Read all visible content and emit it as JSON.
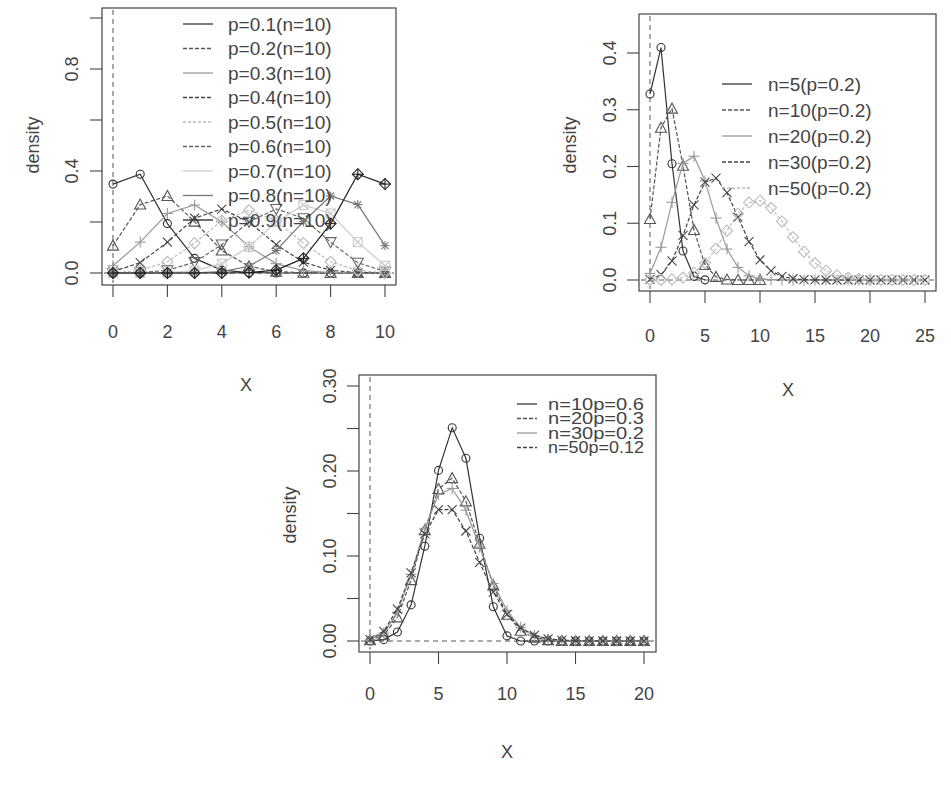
{
  "chart_data": [
    {
      "type": "line",
      "title": "",
      "xlabel": "X",
      "ylabel": "density",
      "xlim": [
        0,
        10
      ],
      "ylim": [
        0,
        1
      ],
      "x_ticks": [
        0,
        2,
        4,
        6,
        8,
        10
      ],
      "y_ticks": [
        0.0,
        0.2,
        0.4,
        0.6,
        0.8,
        1.0
      ],
      "y_tick_labels": [
        "0.0",
        "",
        "0.4",
        "",
        "0.8",
        ""
      ],
      "grid": false,
      "legend_position": "top-center",
      "x": [
        0,
        1,
        2,
        3,
        4,
        5,
        6,
        7,
        8,
        9,
        10
      ],
      "series": [
        {
          "name": "p=0.1(n=10)",
          "marker": "circle",
          "color": "#333333",
          "dash": "",
          "values": [
            0.3487,
            0.3874,
            0.1937,
            0.0574,
            0.0112,
            0.0015,
            0.0001,
            0.0,
            0.0,
            0.0,
            0.0
          ]
        },
        {
          "name": "p=0.2(n=10)",
          "marker": "triangle",
          "color": "#555555",
          "dash": "4,2",
          "values": [
            0.1074,
            0.2684,
            0.302,
            0.2013,
            0.0881,
            0.0264,
            0.0055,
            0.0008,
            0.0001,
            0.0,
            0.0
          ]
        },
        {
          "name": "p=0.3(n=10)",
          "marker": "plus",
          "color": "#999999",
          "dash": "",
          "values": [
            0.0282,
            0.1211,
            0.2335,
            0.2668,
            0.2001,
            0.1029,
            0.0368,
            0.009,
            0.0014,
            0.0001,
            0.0
          ]
        },
        {
          "name": "p=0.4(n=10)",
          "marker": "cross",
          "color": "#444444",
          "dash": "4,2",
          "values": [
            0.006,
            0.0403,
            0.1209,
            0.215,
            0.2508,
            0.2007,
            0.1115,
            0.0425,
            0.0106,
            0.0016,
            0.0001
          ]
        },
        {
          "name": "p=0.5(n=10)",
          "marker": "diamond",
          "color": "#bbbbbb",
          "dash": "3,2",
          "values": [
            0.001,
            0.0098,
            0.0439,
            0.1172,
            0.2051,
            0.2461,
            0.2051,
            0.1172,
            0.0439,
            0.0098,
            0.001
          ]
        },
        {
          "name": "p=0.6(n=10)",
          "marker": "triangle-down",
          "color": "#666666",
          "dash": "4,2",
          "values": [
            0.0001,
            0.0016,
            0.0106,
            0.0425,
            0.1115,
            0.2007,
            0.2508,
            0.215,
            0.1209,
            0.0403,
            0.006
          ]
        },
        {
          "name": "p=0.7(n=10)",
          "marker": "square-x",
          "color": "#cccccc",
          "dash": "",
          "values": [
            0.0,
            0.0001,
            0.0014,
            0.009,
            0.0368,
            0.1029,
            0.2001,
            0.2668,
            0.2335,
            0.1211,
            0.0282
          ]
        },
        {
          "name": "p=0.8(n=10)",
          "marker": "asterisk",
          "color": "#777777",
          "dash": "",
          "values": [
            0.0,
            0.0,
            0.0001,
            0.0008,
            0.0055,
            0.0264,
            0.0881,
            0.2013,
            0.302,
            0.2684,
            0.1074
          ]
        },
        {
          "name": "p=0.9(n=10)",
          "marker": "diamond-plus",
          "color": "#222222",
          "dash": "",
          "values": [
            0.0,
            0.0,
            0.0,
            0.0,
            0.0001,
            0.0015,
            0.0112,
            0.0574,
            0.1937,
            0.3874,
            0.3487
          ]
        }
      ]
    },
    {
      "type": "line",
      "title": "",
      "xlabel": "X",
      "ylabel": "density",
      "xlim": [
        0,
        25
      ],
      "ylim": [
        0,
        0.45
      ],
      "x_ticks": [
        0,
        5,
        10,
        15,
        20,
        25
      ],
      "y_ticks": [
        0.0,
        0.1,
        0.2,
        0.3,
        0.4
      ],
      "y_tick_labels": [
        "0.0",
        "0.1",
        "0.2",
        "0.3",
        "0.4"
      ],
      "grid": false,
      "legend_position": "top-right",
      "series": [
        {
          "name": "n=5(p=0.2)",
          "marker": "circle",
          "color": "#333333",
          "dash": "",
          "x": [
            0,
            1,
            2,
            3,
            4,
            5
          ],
          "values": [
            0.3277,
            0.4096,
            0.2048,
            0.0512,
            0.0064,
            0.0003
          ]
        },
        {
          "name": "n=10(p=0.2)",
          "marker": "triangle",
          "color": "#555555",
          "dash": "4,2",
          "x": [
            0,
            1,
            2,
            3,
            4,
            5,
            6,
            7,
            8,
            9,
            10
          ],
          "values": [
            0.1074,
            0.2684,
            0.302,
            0.2013,
            0.0881,
            0.0264,
            0.0055,
            0.0008,
            0.0001,
            0.0,
            0.0
          ]
        },
        {
          "name": "n=20(p=0.2)",
          "marker": "plus",
          "color": "#999999",
          "dash": "",
          "x": [
            0,
            1,
            2,
            3,
            4,
            5,
            6,
            7,
            8,
            9,
            10,
            11,
            12,
            13,
            14,
            15,
            16,
            17,
            18,
            19,
            20
          ],
          "values": [
            0.0115,
            0.0576,
            0.1369,
            0.2054,
            0.2182,
            0.1746,
            0.1091,
            0.0545,
            0.0222,
            0.0074,
            0.002,
            0.0005,
            0.0001,
            0,
            0,
            0,
            0,
            0,
            0,
            0,
            0
          ]
        },
        {
          "name": "n=30(p=0.2)",
          "marker": "cross",
          "color": "#444444",
          "dash": "4,2",
          "x": [
            0,
            1,
            2,
            3,
            4,
            5,
            6,
            7,
            8,
            9,
            10,
            11,
            12,
            13,
            14,
            15,
            16,
            17,
            18,
            19,
            20,
            21,
            22,
            23,
            24,
            25
          ],
          "values": [
            0.0012,
            0.0093,
            0.0337,
            0.0785,
            0.1325,
            0.1723,
            0.1795,
            0.1538,
            0.1106,
            0.0676,
            0.0355,
            0.0161,
            0.0064,
            0.0022,
            0.0007,
            0.0002,
            0.0,
            0,
            0,
            0,
            0,
            0,
            0,
            0,
            0,
            0
          ]
        },
        {
          "name": "n=50(p=0.2)",
          "marker": "diamond",
          "color": "#bbbbbb",
          "dash": "3,2",
          "x": [
            0,
            1,
            2,
            3,
            4,
            5,
            6,
            7,
            8,
            9,
            10,
            11,
            12,
            13,
            14,
            15,
            16,
            17,
            18,
            19,
            20,
            21,
            22,
            23,
            24,
            25
          ],
          "values": [
            0.0,
            0.0002,
            0.0011,
            0.0044,
            0.0128,
            0.0295,
            0.0554,
            0.087,
            0.1169,
            0.1364,
            0.1398,
            0.1271,
            0.1033,
            0.0755,
            0.0499,
            0.0299,
            0.0164,
            0.0082,
            0.0037,
            0.0016,
            0.0006,
            0.0002,
            0.0001,
            0,
            0,
            0
          ]
        }
      ]
    },
    {
      "type": "line",
      "title": "",
      "xlabel": "X",
      "ylabel": "density",
      "xlim": [
        0,
        20
      ],
      "ylim": [
        0,
        0.3
      ],
      "x_ticks": [
        0,
        5,
        10,
        15,
        20
      ],
      "y_ticks": [
        0.0,
        0.05,
        0.1,
        0.15,
        0.2,
        0.25,
        0.3
      ],
      "y_tick_labels": [
        "0.00",
        "",
        "0.10",
        "",
        "0.20",
        "",
        "0.30"
      ],
      "grid": false,
      "legend_position": "top-right",
      "series": [
        {
          "name": "n=10p=0.6",
          "marker": "circle",
          "color": "#333333",
          "dash": "",
          "x": [
            0,
            1,
            2,
            3,
            4,
            5,
            6,
            7,
            8,
            9,
            10,
            11,
            12,
            13,
            14,
            15,
            16,
            17,
            18,
            19,
            20
          ],
          "values": [
            0.0001,
            0.0016,
            0.0106,
            0.0425,
            0.1115,
            0.2007,
            0.2508,
            0.215,
            0.1209,
            0.0403,
            0.006,
            0,
            0,
            0,
            0,
            0,
            0,
            0,
            0,
            0,
            0
          ]
        },
        {
          "name": "n=20p=0.3",
          "marker": "triangle",
          "color": "#555555",
          "dash": "4,2",
          "x": [
            0,
            1,
            2,
            3,
            4,
            5,
            6,
            7,
            8,
            9,
            10,
            11,
            12,
            13,
            14,
            15,
            16,
            17,
            18,
            19,
            20
          ],
          "values": [
            0.0008,
            0.0068,
            0.0278,
            0.0716,
            0.1304,
            0.1789,
            0.1916,
            0.1643,
            0.1144,
            0.0654,
            0.0308,
            0.012,
            0.0039,
            0.001,
            0.0002,
            0.0,
            0,
            0,
            0,
            0,
            0
          ]
        },
        {
          "name": "n=30p=0.2",
          "marker": "plus",
          "color": "#999999",
          "dash": "",
          "x": [
            0,
            1,
            2,
            3,
            4,
            5,
            6,
            7,
            8,
            9,
            10,
            11,
            12,
            13,
            14,
            15,
            16,
            17,
            18,
            19,
            20
          ],
          "values": [
            0.0012,
            0.0093,
            0.0337,
            0.0785,
            0.1325,
            0.1723,
            0.1795,
            0.1538,
            0.1106,
            0.0676,
            0.0355,
            0.0161,
            0.0064,
            0.0022,
            0.0007,
            0.0002,
            0.0,
            0,
            0,
            0,
            0
          ]
        },
        {
          "name": "n=50p=0.12",
          "marker": "cross",
          "color": "#444444",
          "dash": "4,2",
          "x": [
            0,
            1,
            2,
            3,
            4,
            5,
            6,
            7,
            8,
            9,
            10,
            11,
            12,
            13,
            14,
            15,
            16,
            17,
            18,
            19,
            20
          ],
          "values": [
            0.0017,
            0.0114,
            0.0375,
            0.0802,
            0.1259,
            0.1545,
            0.1545,
            0.1294,
            0.0926,
            0.0575,
            0.0314,
            0.0152,
            0.0066,
            0.0026,
            0.0009,
            0.0003,
            0.0001,
            0,
            0,
            0,
            0
          ]
        }
      ]
    }
  ]
}
